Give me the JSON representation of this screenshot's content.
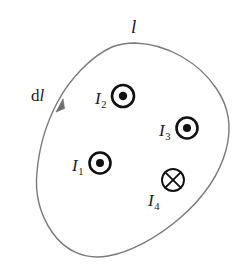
{
  "figure": {
    "type": "physics-diagram",
    "background_color": "#ffffff",
    "curve_color": "#7a7a7a",
    "symbol_color": "#111111",
    "text_color": "#1a1a1a",
    "loop": {
      "name": "closed-amperian-loop",
      "stroke_width": 1.4,
      "direction_label": "counterclockwise-at-arrow"
    },
    "labels": {
      "loop_label": "l",
      "element_label_prefix": "d",
      "element_label_symbol": "l"
    },
    "currents": [
      {
        "id": "I1",
        "base": "I",
        "subscript": "1",
        "symbol": "dot-in-circle",
        "direction": "out-of-page",
        "label_position": "left",
        "cx": 100,
        "cy": 163,
        "outer_r": 10.5,
        "dot_r": 4.0
      },
      {
        "id": "I2",
        "base": "I",
        "subscript": "2",
        "symbol": "dot-in-circle",
        "direction": "out-of-page",
        "label_position": "left",
        "cx": 123,
        "cy": 96,
        "outer_r": 11.0,
        "dot_r": 4.2
      },
      {
        "id": "I3",
        "base": "I",
        "subscript": "3",
        "symbol": "dot-in-circle",
        "direction": "out-of-page",
        "label_position": "left",
        "cx": 187,
        "cy": 128,
        "outer_r": 10.5,
        "dot_r": 4.0
      },
      {
        "id": "I4",
        "base": "I",
        "subscript": "4",
        "symbol": "cross-in-circle",
        "direction": "into-page",
        "label_position": "below-left",
        "cx": 173,
        "cy": 180,
        "outer_r": 11.0
      }
    ]
  }
}
